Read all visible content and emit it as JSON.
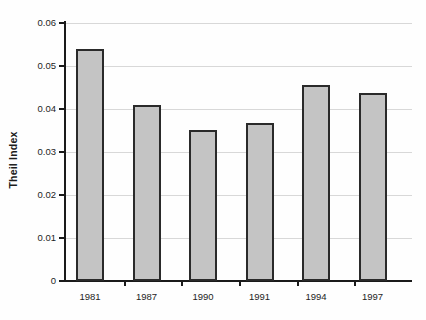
{
  "chart_data": {
    "type": "bar",
    "title": "",
    "subtitle": "",
    "xlabel": "",
    "ylabel": "Theil Index",
    "categories": [
      "1981",
      "1987",
      "1990",
      "1991",
      "1994",
      "1997"
    ],
    "values": [
      0.054,
      0.041,
      0.0352,
      0.0368,
      0.0455,
      0.0438
    ],
    "series": [
      {
        "name": "Theil Index",
        "values": [
          0.054,
          0.041,
          0.0352,
          0.0368,
          0.0455,
          0.0438
        ]
      }
    ],
    "ylim": [
      0,
      0.06
    ],
    "y_ticks": [
      0,
      0.01,
      0.02,
      0.03,
      0.04,
      0.05,
      0.06
    ],
    "y_tick_labels": [
      "0",
      "0.01",
      "0.02",
      "0.03",
      "0.04",
      "0.05",
      "0.06"
    ],
    "grid": true,
    "grid_axis": "y",
    "legend": false,
    "legend_position": "none",
    "bar_fill_color": "#c4c4c4",
    "bar_edge_color": "#2a2a2a",
    "background_color": "#ffffff",
    "gridline_color": "#d8d8d8",
    "axis_color": "#1a1a1a"
  }
}
